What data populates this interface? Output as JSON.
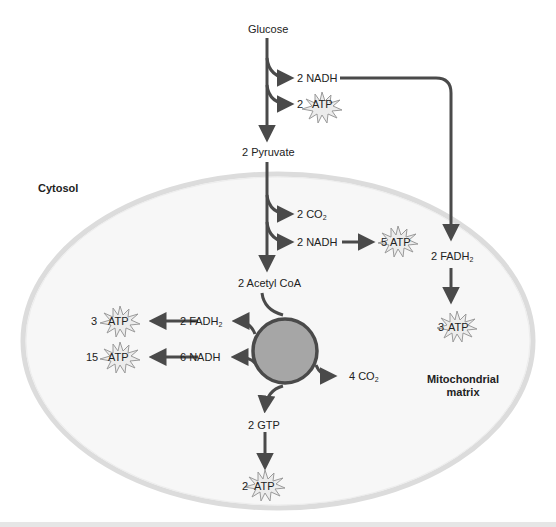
{
  "diagram": {
    "regions": {
      "cytosol": "Cytosol",
      "matrix_line1": "Mitochondrial",
      "matrix_line2": "matrix"
    },
    "glycolysis": {
      "start": "Glucose",
      "nadh": "2 NADH",
      "atp_count": "2",
      "end": "2 Pyruvate"
    },
    "shuttle": {
      "fadh2_prefix": "2 FADH",
      "fadh2_sub": "2",
      "atp_count": "3"
    },
    "pyruvate_oxidation": {
      "co2_prefix": "2 CO",
      "co2_sub": "2",
      "nadh": "2 NADH",
      "atp_count": "5",
      "product": "2 Acetyl CoA"
    },
    "krebs_cycle": {
      "fadh2_prefix": "2 FADH",
      "fadh2_sub": "2",
      "fadh2_atp_count": "3",
      "nadh": "6 NADH",
      "nadh_atp_count": "15",
      "co2_prefix": "4 CO",
      "co2_sub": "2",
      "gtp": "2 GTP",
      "gtp_atp_count": "2"
    },
    "atp_label": "ATP",
    "colors": {
      "arrow": "#4a4a4a",
      "cycle_fill": "#a6a6a6",
      "cycle_stroke": "#4a4a4a",
      "membrane": "#dcdcdc",
      "matrix_fill": "#f7f7f7",
      "atp_star_fill": "#ececec",
      "atp_star_stroke": "#9a9a9a"
    }
  }
}
